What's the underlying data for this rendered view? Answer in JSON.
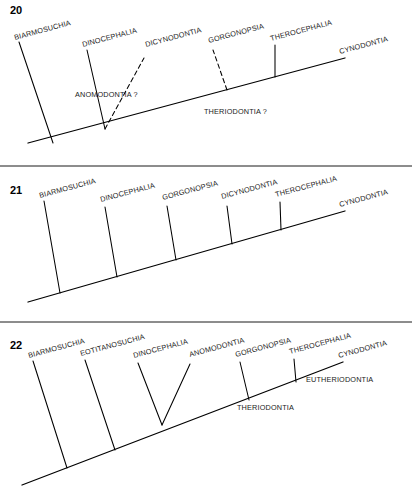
{
  "figure": {
    "width": 412,
    "height": 500,
    "background_color": "#ffffff",
    "line_color": "#000000",
    "text_color": "#1a1a1a"
  },
  "chart_data": {
    "type": "diagram",
    "subtype": "cladogram",
    "title": "",
    "panels": [
      {
        "number": "20",
        "number_pos": {
          "x": 10,
          "y": 14
        },
        "backbone": {
          "x1": 28,
          "y1": 143,
          "x2": 345,
          "y2": 58
        },
        "tip_label": {
          "text": "CYNODONTIA",
          "x": 340,
          "y": 54,
          "rotate": -15
        },
        "branches": [
          {
            "taxon": "BIARMOSUCHIA",
            "style": "solid",
            "x1": 53,
            "y1": 143,
            "x2": 19,
            "y2": 42,
            "label_x": 15,
            "label_y": 40,
            "rotate": -15
          },
          {
            "taxon": "DINOCEPHALIA",
            "style": "solid",
            "x1": 105,
            "y1": 129,
            "x2": 87,
            "y2": 50,
            "label_x": 83,
            "label_y": 47,
            "rotate": -15
          },
          {
            "taxon": "DICYNODONTIA",
            "style": "dashed",
            "x1": 105,
            "y1": 129,
            "x2": 144,
            "y2": 58,
            "label_x": 146,
            "label_y": 47,
            "rotate": -15
          },
          {
            "taxon": "GORGONOPSIA",
            "style": "dashed",
            "x1": 227,
            "y1": 90,
            "x2": 213,
            "y2": 50,
            "label_x": 209,
            "label_y": 43,
            "rotate": -15
          },
          {
            "taxon": "THEROCEPHALIA",
            "style": "solid",
            "x1": 275,
            "y1": 77,
            "x2": 275,
            "y2": 45,
            "label_x": 271,
            "label_y": 41,
            "rotate": -15
          }
        ],
        "clade_labels": [
          {
            "text": "ANOMODONTIA ?",
            "x": 75,
            "y": 97,
            "rotate": 0
          },
          {
            "text": "THERIODONTIA ?",
            "x": 204,
            "y": 114,
            "rotate": 0
          }
        ]
      },
      {
        "number": "21",
        "number_pos": {
          "x": 10,
          "y": 194
        },
        "backbone": {
          "x1": 28,
          "y1": 302,
          "x2": 345,
          "y2": 211
        },
        "tip_label": {
          "text": "CYNODONTIA",
          "x": 340,
          "y": 207,
          "rotate": -15
        },
        "branches": [
          {
            "taxon": "BIARMOSUCHIA",
            "style": "solid",
            "x1": 60,
            "y1": 293,
            "x2": 44,
            "y2": 201,
            "label_x": 40,
            "label_y": 198,
            "rotate": -15
          },
          {
            "taxon": "DINOCEPHALIA",
            "style": "solid",
            "x1": 117,
            "y1": 277,
            "x2": 105,
            "y2": 207,
            "label_x": 101,
            "label_y": 202,
            "rotate": -15
          },
          {
            "taxon": "GORGONOPSIA",
            "style": "solid",
            "x1": 176,
            "y1": 260,
            "x2": 167,
            "y2": 206,
            "label_x": 163,
            "label_y": 200,
            "rotate": -15
          },
          {
            "taxon": "DICYNODONTIA",
            "style": "solid",
            "x1": 232,
            "y1": 244,
            "x2": 227,
            "y2": 206,
            "label_x": 222,
            "label_y": 199,
            "rotate": -15
          },
          {
            "taxon": "THEROCEPHALIA",
            "style": "solid",
            "x1": 281,
            "y1": 230,
            "x2": 280,
            "y2": 202,
            "label_x": 276,
            "label_y": 197,
            "rotate": -15
          }
        ],
        "clade_labels": []
      },
      {
        "number": "22",
        "number_pos": {
          "x": 10,
          "y": 349
        },
        "backbone": {
          "x1": 22,
          "y1": 485,
          "x2": 343,
          "y2": 362
        },
        "tip_label": {
          "text": "CYNODONTIA",
          "x": 339,
          "y": 358,
          "rotate": -15
        },
        "branches": [
          {
            "taxon": "BIARMOSUCHIA",
            "style": "solid",
            "x1": 67,
            "y1": 468,
            "x2": 33,
            "y2": 361,
            "label_x": 29,
            "label_y": 358,
            "rotate": -15
          },
          {
            "taxon": "EOTITANOSUCHIA",
            "style": "solid",
            "x1": 115,
            "y1": 450,
            "x2": 85,
            "y2": 360,
            "label_x": 81,
            "label_y": 356,
            "rotate": -15
          },
          {
            "taxon": "DINOCEPHALIA",
            "style": "solid",
            "x1": 162,
            "y1": 425,
            "x2": 138,
            "y2": 363,
            "label_x": 134,
            "label_y": 358,
            "rotate": -15
          },
          {
            "taxon": "ANOMODONTIA",
            "style": "solid",
            "x1": 162,
            "y1": 425,
            "x2": 190,
            "y2": 364,
            "label_x": 190,
            "label_y": 357,
            "rotate": -15
          },
          {
            "taxon": "GORGONOPSIA",
            "style": "solid",
            "x1": 249,
            "y1": 400,
            "x2": 240,
            "y2": 362,
            "label_x": 236,
            "label_y": 357,
            "rotate": -15
          },
          {
            "taxon": "THEROCEPHALIA",
            "style": "solid",
            "x1": 296,
            "y1": 382,
            "x2": 294,
            "y2": 359,
            "label_x": 290,
            "label_y": 354,
            "rotate": -15
          }
        ],
        "clade_labels": [
          {
            "text": "EUTHERIODONTIA",
            "x": 306,
            "y": 382,
            "rotate": 0
          },
          {
            "text": "THERIODONTIA",
            "x": 237,
            "y": 410,
            "rotate": 0
          }
        ]
      }
    ],
    "dividers": [
      {
        "x1": 0,
        "y1": 166,
        "x2": 412,
        "y2": 166
      },
      {
        "x1": 0,
        "y1": 322,
        "x2": 412,
        "y2": 322
      }
    ]
  }
}
